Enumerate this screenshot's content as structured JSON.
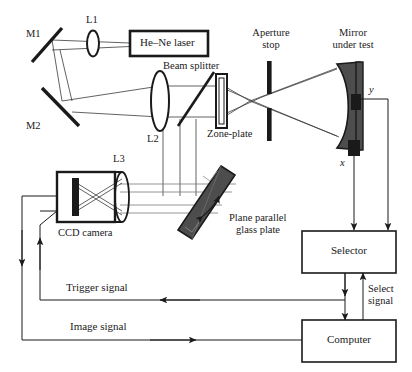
{
  "figure": {
    "type": "optical-interferometer-schematic",
    "title": "",
    "stroke_color": "#1a1a1a",
    "fill_dark": "#4d4d4d",
    "fill_black": "#1a1a1a",
    "ray_color": "#3a3a3a"
  },
  "labels": {
    "m1": "M1",
    "m2": "M2",
    "l1": "L1",
    "l2": "L2",
    "l3": "L3",
    "laser": "He–Ne laser",
    "beam_splitter": "Beam splitter",
    "zone_plate": "Zone-plate",
    "aperture_stop_line1": "Aperture",
    "aperture_stop_line2": "stop",
    "mirror_line1": "Mirror",
    "mirror_line2": "under test",
    "axis_y": "y",
    "axis_x": "x",
    "ccd_camera": "CCD camera",
    "glass_plate_line1": "Plane parallel",
    "glass_plate_line2": "glass plate",
    "selector": "Selector",
    "computer": "Computer",
    "select_signal_line1": "Select",
    "select_signal_line2": "signal",
    "trigger_signal": "Trigger signal",
    "image_signal": "Image signal"
  },
  "components": [
    {
      "name": "mirror-m1",
      "label": "M1",
      "kind": "flat-mirror"
    },
    {
      "name": "mirror-m2",
      "label": "M2",
      "kind": "flat-mirror"
    },
    {
      "name": "lens-l1",
      "label": "L1",
      "kind": "lens"
    },
    {
      "name": "lens-l2",
      "label": "L2",
      "kind": "lens"
    },
    {
      "name": "lens-l3",
      "label": "L3",
      "kind": "lens"
    },
    {
      "name": "he-ne-laser",
      "label": "He–Ne laser",
      "kind": "source-box"
    },
    {
      "name": "beam-splitter",
      "label": "Beam splitter",
      "kind": "tilted-plate"
    },
    {
      "name": "zone-plate",
      "label": "Zone-plate",
      "kind": "plate"
    },
    {
      "name": "aperture-stop",
      "label": "Aperture stop",
      "kind": "stop"
    },
    {
      "name": "mirror-under-test",
      "label": "Mirror under test",
      "kind": "concave-mirror"
    },
    {
      "name": "ccd-camera",
      "label": "CCD camera",
      "kind": "detector-box"
    },
    {
      "name": "plane-parallel-glass-plate",
      "label": "Plane parallel glass plate",
      "kind": "tilted-slab"
    },
    {
      "name": "selector-box",
      "label": "Selector",
      "kind": "block"
    },
    {
      "name": "computer-box",
      "label": "Computer",
      "kind": "block"
    }
  ],
  "signals": [
    {
      "name": "x-actuator",
      "label": "x",
      "from": "mirror-under-test",
      "to": "selector-box"
    },
    {
      "name": "y-actuator",
      "label": "y",
      "from": "mirror-under-test",
      "to": "selector-box"
    },
    {
      "name": "select-signal",
      "label": "Select signal",
      "from": "computer-box",
      "to": "selector-box"
    },
    {
      "name": "trigger-signal",
      "label": "Trigger signal",
      "from": "computer-box",
      "to": "ccd-camera"
    },
    {
      "name": "image-signal",
      "label": "Image signal",
      "from": "ccd-camera",
      "to": "computer-box"
    }
  ]
}
